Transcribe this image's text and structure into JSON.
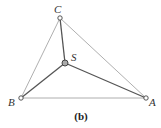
{
  "diagram": {
    "caption": "(b)",
    "colors": {
      "outer_edge": "#9a9a9a",
      "inner_edge": "#555555",
      "node_stroke": "#444444",
      "node_fill": "#ffffff",
      "center_fill": "#aaaaaa"
    },
    "nodes": [
      {
        "id": "C",
        "label": "C",
        "x": 60,
        "y": 18,
        "label_x": 54,
        "label_y": 13
      },
      {
        "id": "S",
        "label": "S",
        "x": 65,
        "y": 63,
        "label_x": 71,
        "label_y": 61
      },
      {
        "id": "B",
        "label": "B",
        "x": 21,
        "y": 98,
        "label_x": 8,
        "label_y": 106
      },
      {
        "id": "A",
        "label": "A",
        "x": 146,
        "y": 98,
        "label_x": 149,
        "label_y": 106
      }
    ],
    "edges": [
      {
        "from": "C",
        "to": "B",
        "style": "thin"
      },
      {
        "from": "C",
        "to": "A",
        "style": "thin"
      },
      {
        "from": "B",
        "to": "A",
        "style": "thin"
      },
      {
        "from": "S",
        "to": "C",
        "style": "thick"
      },
      {
        "from": "S",
        "to": "B",
        "style": "thick"
      },
      {
        "from": "S",
        "to": "A",
        "style": "thick"
      }
    ]
  }
}
